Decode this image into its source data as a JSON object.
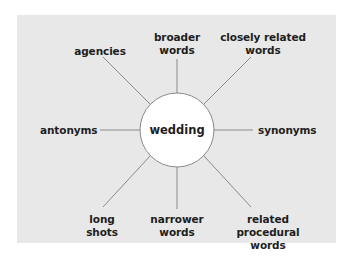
{
  "diagram": {
    "center": {
      "label": "wedding"
    },
    "nodes": [
      {
        "id": "agencies",
        "label": "agencies"
      },
      {
        "id": "broader",
        "label": "broader\nwords"
      },
      {
        "id": "closely",
        "label": "closely related\nwords"
      },
      {
        "id": "antonyms",
        "label": "antonyms"
      },
      {
        "id": "synonyms",
        "label": "synonyms"
      },
      {
        "id": "long",
        "label": "long\nshots"
      },
      {
        "id": "narrower",
        "label": "narrower\nwords"
      },
      {
        "id": "procedural",
        "label": "related\nprocedural\nwords"
      }
    ],
    "colors": {
      "panel": "#e8e8e8",
      "line": "#8a8a8a",
      "circle_fill": "#ffffff",
      "text": "#1e1e1e"
    }
  }
}
